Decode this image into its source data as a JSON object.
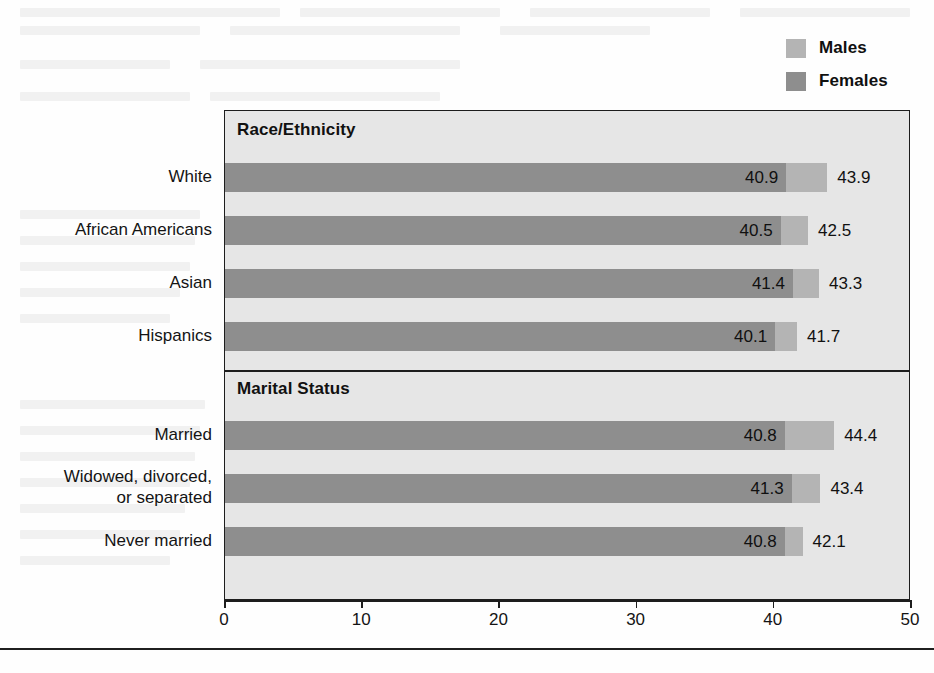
{
  "legend": {
    "items": [
      {
        "label": "Males",
        "color": "#b4b4b4",
        "icon": "legend-swatch-icon"
      },
      {
        "label": "Females",
        "color": "#8e8e8e",
        "icon": "legend-swatch-icon"
      }
    ]
  },
  "axis": {
    "ticks": [
      "0",
      "10",
      "20",
      "30",
      "40",
      "50"
    ]
  },
  "panels": [
    {
      "title": "Race/Ethnicity"
    },
    {
      "title": "Marital Status"
    }
  ],
  "chart_data": {
    "type": "bar",
    "orientation": "horizontal",
    "title": "",
    "subtitle": "",
    "xlabel": "",
    "ylabel": "",
    "xlim": [
      0,
      50
    ],
    "xticks": [
      0,
      10,
      20,
      30,
      40,
      50
    ],
    "grid": false,
    "legend_position": "top-right",
    "overlap": "overlaid",
    "panels": [
      {
        "title": "Race/Ethnicity",
        "categories": [
          "White",
          "African Americans",
          "Asian",
          "Hispanics"
        ],
        "series": [
          {
            "name": "Males",
            "color": "#b4b4b4",
            "values": [
              43.9,
              42.5,
              43.3,
              41.7
            ]
          },
          {
            "name": "Females",
            "color": "#8e8e8e",
            "values": [
              40.9,
              40.5,
              41.4,
              40.1
            ]
          }
        ]
      },
      {
        "title": "Marital Status",
        "categories": [
          "Married",
          "Widowed, divorced, or separated",
          "Never married"
        ],
        "series": [
          {
            "name": "Males",
            "color": "#b4b4b4",
            "values": [
              44.4,
              43.4,
              42.1
            ]
          },
          {
            "name": "Females",
            "color": "#8e8e8e",
            "values": [
              40.8,
              41.3,
              40.8
            ]
          }
        ]
      }
    ]
  },
  "rows": [
    {
      "panel": 0,
      "label_lines": [
        "White"
      ],
      "male": "43.9",
      "female": "40.9"
    },
    {
      "panel": 0,
      "label_lines": [
        "African Americans"
      ],
      "male": "42.5",
      "female": "40.5"
    },
    {
      "panel": 0,
      "label_lines": [
        "Asian"
      ],
      "male": "43.3",
      "female": "41.4"
    },
    {
      "panel": 0,
      "label_lines": [
        "Hispanics"
      ],
      "male": "41.7",
      "female": "40.1"
    },
    {
      "panel": 1,
      "label_lines": [
        "Married"
      ],
      "male": "44.4",
      "female": "40.8"
    },
    {
      "panel": 1,
      "label_lines": [
        "Widowed, divorced,",
        "or separated"
      ],
      "male": "43.4",
      "female": "41.3"
    },
    {
      "panel": 1,
      "label_lines": [
        "Never married"
      ],
      "male": "42.1",
      "female": "40.8"
    }
  ]
}
